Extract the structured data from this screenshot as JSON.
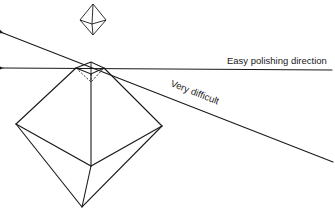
{
  "diagram": {
    "labels": {
      "easy": "Easy polishing direction",
      "difficult": "Very difficult"
    },
    "colors": {
      "ink": "#1a1a1a",
      "background": "#ffffff"
    }
  }
}
